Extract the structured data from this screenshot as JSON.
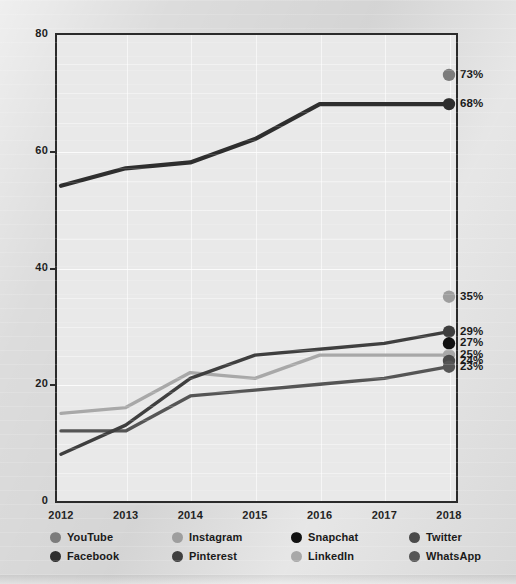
{
  "chart_data": {
    "type": "line",
    "title": "",
    "xlabel": "",
    "ylabel": "",
    "x": [
      2012,
      2013,
      2014,
      2015,
      2016,
      2017,
      2018
    ],
    "categories": [
      "2012",
      "2013",
      "2014",
      "2015",
      "2016",
      "2017",
      "2018"
    ],
    "xtick_labels": [
      "2012",
      "2013",
      "2014",
      "2015",
      "2016",
      "2017",
      "2018"
    ],
    "ytick_labels": [
      "0",
      "20",
      "40",
      "60",
      "80"
    ],
    "ytick_values": [
      0,
      20,
      40,
      60,
      80
    ],
    "ylim": [
      0,
      80
    ],
    "xlim": [
      2012,
      2018
    ],
    "grid": true,
    "legend_position": "bottom",
    "value_suffix": "%",
    "series": [
      {
        "name": "YouTube",
        "color": "#7c7c7c",
        "end_label": "73%",
        "end_value": 73,
        "values": [
          null,
          null,
          null,
          null,
          null,
          null,
          73
        ]
      },
      {
        "name": "Facebook",
        "color": "#2e2e2e",
        "end_label": "68%",
        "end_value": 68,
        "values": [
          54,
          57,
          58,
          62,
          68,
          68,
          68
        ]
      },
      {
        "name": "Instagram",
        "color": "#9e9e9e",
        "end_label": "35%",
        "end_value": 35,
        "values": [
          null,
          null,
          null,
          null,
          null,
          null,
          35
        ]
      },
      {
        "name": "Pinterest",
        "color": "#3f3f3f",
        "end_label": "29%",
        "end_value": 29,
        "values": [
          8,
          13,
          21,
          25,
          26,
          27,
          29
        ]
      },
      {
        "name": "Snapchat",
        "color": "#111111",
        "end_label": "27%",
        "end_value": 27,
        "values": [
          null,
          null,
          null,
          null,
          null,
          null,
          27
        ]
      },
      {
        "name": "LinkedIn",
        "color": "#a8a8a8",
        "end_label": "25%",
        "end_value": 25,
        "values": [
          15,
          16,
          22,
          21,
          25,
          25,
          25
        ]
      },
      {
        "name": "Twitter",
        "color": "#4a4a4a",
        "end_label": "24%",
        "end_value": 24,
        "values": [
          null,
          null,
          null,
          null,
          null,
          null,
          24
        ]
      },
      {
        "name": "WhatsApp",
        "color": "#555555",
        "end_label": "23%",
        "end_value": 23,
        "values": [
          12,
          12,
          18,
          19,
          20,
          21,
          23
        ]
      }
    ],
    "end_labels": [
      "73%",
      "68%",
      "35%",
      "29%",
      "27%",
      "25%",
      "24%",
      "23%"
    ]
  },
  "axis": {
    "y_ticks": [
      {
        "label": "80",
        "value": 80
      },
      {
        "label": "60",
        "value": 60
      },
      {
        "label": "40",
        "value": 40
      },
      {
        "label": "20",
        "value": 20
      },
      {
        "label": "0",
        "value": 0
      }
    ],
    "x_ticks": [
      {
        "label": "2012"
      },
      {
        "label": "2013"
      },
      {
        "label": "2014"
      },
      {
        "label": "2015"
      },
      {
        "label": "2016"
      },
      {
        "label": "2017"
      },
      {
        "label": "2018"
      }
    ]
  },
  "legend": {
    "items": [
      {
        "label": "YouTube",
        "color": "#7c7c7c"
      },
      {
        "label": "Instagram",
        "color": "#9e9e9e"
      },
      {
        "label": "Snapchat",
        "color": "#111111"
      },
      {
        "label": "Twitter",
        "color": "#4a4a4a"
      },
      {
        "label": "Facebook",
        "color": "#2e2e2e"
      },
      {
        "label": "Pinterest",
        "color": "#3f3f3f"
      },
      {
        "label": "LinkedIn",
        "color": "#a8a8a8"
      },
      {
        "label": "WhatsApp",
        "color": "#555555"
      }
    ]
  },
  "end_markers": [
    {
      "label": "73%",
      "value": 73,
      "color": "#7c7c7c",
      "series": "YouTube"
    },
    {
      "label": "68%",
      "value": 68,
      "color": "#2e2e2e",
      "series": "Facebook"
    },
    {
      "label": "35%",
      "value": 35,
      "color": "#9e9e9e",
      "series": "Instagram"
    },
    {
      "label": "29%",
      "value": 29,
      "color": "#3f3f3f",
      "series": "Pinterest"
    },
    {
      "label": "27%",
      "value": 27,
      "color": "#111111",
      "series": "Snapchat"
    },
    {
      "label": "25%",
      "value": 25,
      "color": "#a8a8a8",
      "series": "LinkedIn"
    },
    {
      "label": "24%",
      "value": 24,
      "color": "#4a4a4a",
      "series": "Twitter"
    },
    {
      "label": "23%",
      "value": 23,
      "color": "#555555",
      "series": "WhatsApp"
    }
  ]
}
